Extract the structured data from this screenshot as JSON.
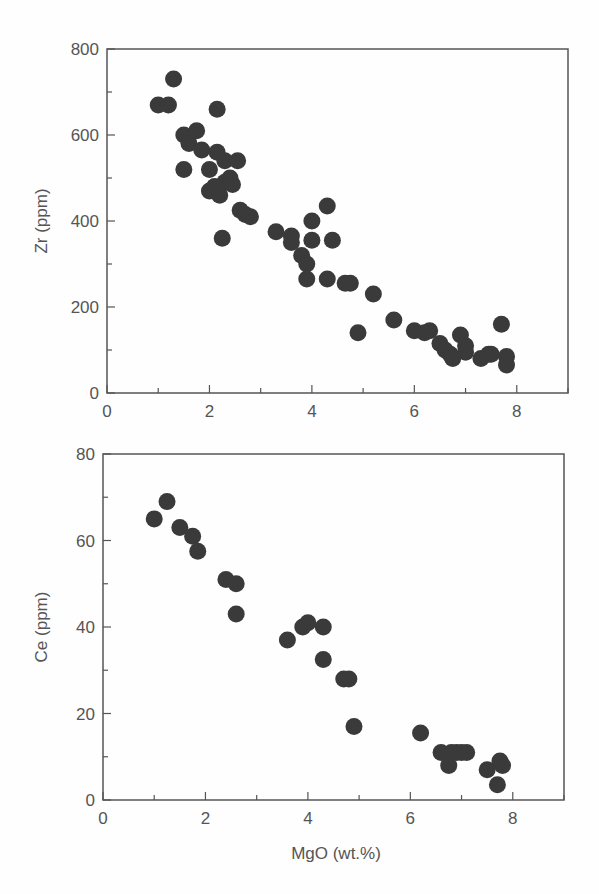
{
  "chart_data": [
    {
      "type": "scatter",
      "title": "",
      "xlabel": "",
      "ylabel": "Zr (ppm)",
      "xlim": [
        0,
        9
      ],
      "ylim": [
        0,
        800
      ],
      "xticks": [
        0,
        2,
        4,
        6,
        8
      ],
      "yticks": [
        0,
        200,
        400,
        600,
        800
      ],
      "grid": false,
      "legend": null,
      "series": [
        {
          "name": "Zr",
          "x": [
            1.0,
            1.2,
            1.3,
            1.5,
            1.5,
            1.6,
            1.75,
            1.85,
            2.0,
            2.0,
            2.1,
            2.15,
            2.15,
            2.3,
            2.3,
            2.2,
            2.4,
            2.45,
            2.55,
            2.25,
            2.6,
            2.7,
            2.8,
            3.3,
            3.6,
            3.6,
            3.8,
            3.9,
            3.9,
            4.0,
            4.0,
            4.3,
            4.4,
            4.3,
            4.65,
            4.75,
            4.9,
            5.2,
            5.6,
            6.0,
            6.2,
            6.3,
            6.5,
            6.6,
            6.7,
            6.75,
            6.9,
            7.0,
            7.0,
            7.3,
            7.45,
            7.5,
            7.7,
            7.8,
            7.8
          ],
          "y": [
            670,
            670,
            730,
            520,
            600,
            580,
            610,
            565,
            520,
            470,
            480,
            560,
            660,
            540,
            490,
            460,
            500,
            485,
            540,
            360,
            425,
            415,
            410,
            375,
            365,
            350,
            320,
            300,
            265,
            400,
            355,
            435,
            355,
            265,
            255,
            255,
            140,
            230,
            170,
            145,
            140,
            145,
            115,
            100,
            90,
            80,
            135,
            110,
            95,
            80,
            90,
            90,
            160,
            85,
            65
          ]
        }
      ]
    },
    {
      "type": "scatter",
      "title": "",
      "xlabel": "MgO (wt.%)",
      "ylabel": "Ce (ppm)",
      "xlim": [
        0,
        9
      ],
      "ylim": [
        0,
        80
      ],
      "xticks": [
        0,
        2,
        4,
        6,
        8
      ],
      "yticks": [
        0,
        20,
        40,
        60,
        80
      ],
      "grid": false,
      "legend": null,
      "series": [
        {
          "name": "Ce",
          "x": [
            1.0,
            1.25,
            1.5,
            1.75,
            1.85,
            2.4,
            2.6,
            2.6,
            3.6,
            3.9,
            4.0,
            4.3,
            4.3,
            4.7,
            4.8,
            4.9,
            6.2,
            6.6,
            6.75,
            6.8,
            6.9,
            7.0,
            7.1,
            7.5,
            7.7,
            7.75,
            7.8
          ],
          "y": [
            65,
            69,
            63,
            61,
            57.5,
            51,
            50,
            43,
            37,
            40,
            41,
            40,
            32.5,
            28,
            28,
            17,
            15.5,
            11,
            8,
            11,
            11,
            11,
            11,
            7,
            3.5,
            9,
            8
          ]
        }
      ]
    }
  ],
  "labels": {
    "top_ylabel": "Zr (ppm)",
    "bottom_ylabel": "Ce (ppm)",
    "xlabel": "MgO (wt.%)"
  },
  "style": {
    "point_color": "#3a3a3a",
    "axis_color": "#555555"
  }
}
